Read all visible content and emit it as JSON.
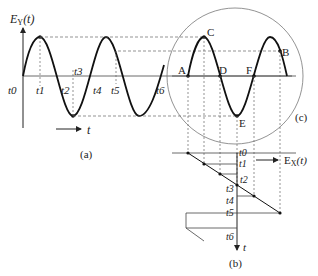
{
  "figure": {
    "panel_a": {
      "y_axis_label": "E",
      "y_axis_sub": "Y",
      "y_axis_arg": "(t)",
      "time_arrow_label": "t",
      "caption": "(a)",
      "time_labels": [
        "t0",
        "t1",
        "t2",
        "t3",
        "t4",
        "t5",
        "t6"
      ]
    },
    "panel_b": {
      "x_axis_label": "E",
      "x_axis_sub": "X",
      "x_axis_arg": "(t)",
      "time_axis_label": "t",
      "caption": "(b)",
      "time_labels": [
        "t0",
        "t1",
        "t2",
        "t3",
        "t4",
        "t5",
        "t6"
      ]
    },
    "panel_c": {
      "caption": "(c)",
      "points": [
        "A",
        "B",
        "C",
        "D",
        "E",
        "F"
      ]
    }
  }
}
